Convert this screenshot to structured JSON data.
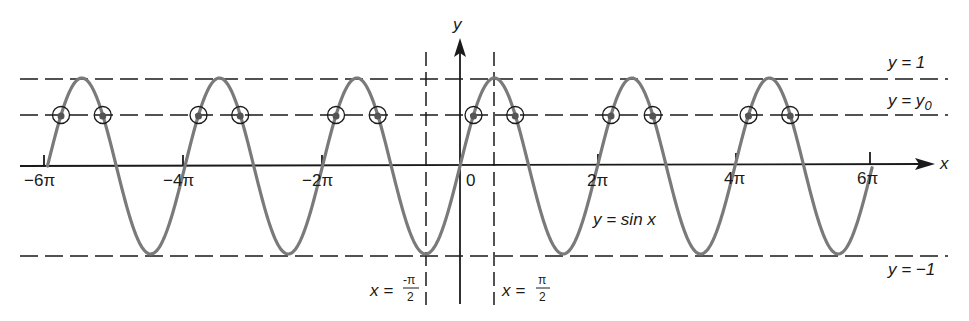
{
  "diagram": {
    "axes": {
      "x_label": "x",
      "y_label": "y",
      "origin_label": "0",
      "x_ticks": [
        "−6π",
        "−4π",
        "−2π",
        "2π",
        "4π",
        "6π"
      ]
    },
    "curve_label": "y = sin x",
    "lines": {
      "upper": "y = 1",
      "y0_left": "y = y",
      "y0_sub": "0",
      "lower": "y = −1"
    },
    "verticals": {
      "left_prefix": "x =",
      "left_num": "-π",
      "left_den": "2",
      "right_prefix": "x =",
      "right_num": "π",
      "right_den": "2"
    },
    "colors": {
      "curve": "#7a7a7a",
      "ink": "#1a1a1a"
    }
  },
  "chart_data": {
    "type": "line",
    "title": "",
    "xlabel": "x",
    "ylabel": "y",
    "series": [
      {
        "name": "y = sin x",
        "function": "sin(x)",
        "x_range": [
          "-6π",
          "6π"
        ]
      }
    ],
    "reference_lines": [
      {
        "name": "y = 1",
        "y": 1,
        "style": "dashed"
      },
      {
        "name": "y = y0",
        "y": 0.6,
        "style": "dashed"
      },
      {
        "name": "y = -1",
        "y": -1,
        "style": "dashed"
      },
      {
        "name": "x = -π/2",
        "x": "-π/2",
        "style": "dashed"
      },
      {
        "name": "x = π/2",
        "x": "π/2",
        "style": "dashed"
      }
    ],
    "x_ticks": [
      "-6π",
      "-4π",
      "-2π",
      "0",
      "2π",
      "4π",
      "6π"
    ],
    "marked_points": "12 circled intersections of sin x with y = y0 (two per period)",
    "xlim": [
      "-6π",
      "6π"
    ],
    "ylim": [
      -1,
      1
    ],
    "grid": false
  }
}
